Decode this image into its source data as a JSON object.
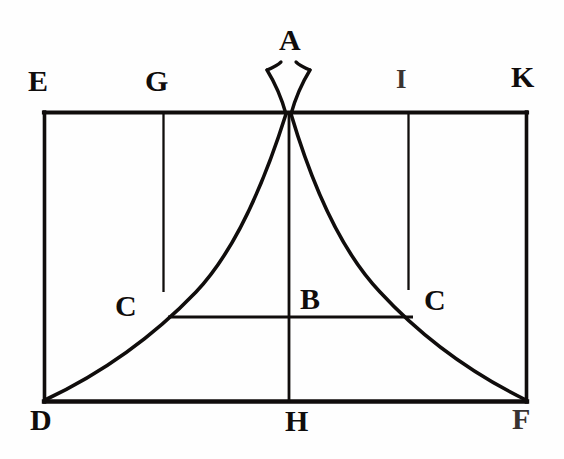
{
  "figure": {
    "type": "line-diagram",
    "background_color": "#fefefe",
    "ink_color": "#100d0c",
    "canvas": {
      "width": 564,
      "height": 459
    }
  },
  "labels": [
    {
      "id": "A",
      "text": "A",
      "x": 279,
      "y": 25,
      "size": "lg",
      "role": "apex-point"
    },
    {
      "id": "E",
      "text": "E",
      "x": 28,
      "y": 66,
      "size": "lg",
      "role": "rectangle-corner-top-left"
    },
    {
      "id": "G",
      "text": "G",
      "x": 145,
      "y": 66,
      "size": "lg",
      "role": "top-edge-point-left"
    },
    {
      "id": "I",
      "text": "I",
      "x": 396,
      "y": 66,
      "size": "md",
      "role": "top-edge-point-right"
    },
    {
      "id": "K",
      "text": "K",
      "x": 511,
      "y": 62,
      "size": "lg",
      "role": "rectangle-corner-top-right"
    },
    {
      "id": "C-left",
      "text": "C",
      "x": 115,
      "y": 291,
      "size": "lg",
      "role": "curve-crossing-left"
    },
    {
      "id": "B",
      "text": "B",
      "x": 300,
      "y": 284,
      "size": "lg",
      "role": "midline-point"
    },
    {
      "id": "C-right",
      "text": "C",
      "x": 424,
      "y": 285,
      "size": "lg",
      "role": "curve-crossing-right"
    },
    {
      "id": "D",
      "text": "D",
      "x": 30,
      "y": 405,
      "size": "lg",
      "role": "rectangle-corner-bottom-left"
    },
    {
      "id": "H",
      "text": "H",
      "x": 285,
      "y": 406,
      "size": "lg",
      "role": "bottom-edge-midpoint"
    },
    {
      "id": "F",
      "text": "F",
      "x": 512,
      "y": 404,
      "size": "lg",
      "role": "rectangle-corner-bottom-right"
    }
  ],
  "geometry": {
    "rectangle": {
      "name": "EKFD",
      "left": 44,
      "right": 527,
      "top": 112,
      "bottom": 402
    },
    "apex": {
      "name": "A",
      "x": 288,
      "y": 112
    },
    "vertical_lines": [
      {
        "name": "GC-left-vertical",
        "x": 163,
        "y1": 112,
        "y2": 292
      },
      {
        "name": "AH-center-vertical",
        "x": 289,
        "y1": 112,
        "y2": 402
      },
      {
        "name": "IC-right-vertical",
        "x": 408,
        "y1": 112,
        "y2": 290
      }
    ],
    "horizontal_chord": {
      "name": "CBC",
      "x1": 168,
      "x2": 413,
      "y": 317
    },
    "curves": [
      {
        "name": "left-curve-DCA",
        "from": "D",
        "to": "A"
      },
      {
        "name": "right-curve-ACF",
        "from": "A",
        "to": "F"
      }
    ],
    "apex_tails": [
      {
        "name": "left-tail",
        "description": "curve flare rising above apex to the left"
      },
      {
        "name": "right-tail",
        "description": "curve flare rising above apex to the right"
      }
    ]
  }
}
